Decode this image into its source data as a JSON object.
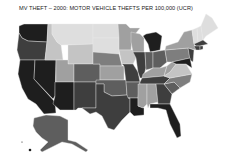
{
  "title": "MV THEFT – 2000: MOTOR VEHICLE THEFTS PER 100,000 (UCR)",
  "legend": null,
  "shades": {
    "very_dark": "#1e1e1e",
    "dark": "#3e3e3e",
    "mid_dark": "#5e5e5e",
    "mid": "#7e7e7e",
    "mid_light": "#a0a0a0",
    "light": "#c4c4c4",
    "very_light": "#dedede"
  },
  "states": [
    {
      "id": "WA",
      "shade": "very_dark"
    },
    {
      "id": "OR",
      "shade": "dark"
    },
    {
      "id": "CA",
      "shade": "very_dark"
    },
    {
      "id": "NV",
      "shade": "very_dark"
    },
    {
      "id": "ID",
      "shade": "light"
    },
    {
      "id": "MT",
      "shade": "very_light"
    },
    {
      "id": "WY",
      "shade": "light"
    },
    {
      "id": "UT",
      "shade": "mid_light"
    },
    {
      "id": "AZ",
      "shade": "very_dark"
    },
    {
      "id": "CO",
      "shade": "mid_dark"
    },
    {
      "id": "NM",
      "shade": "dark"
    },
    {
      "id": "ND",
      "shade": "very_light"
    },
    {
      "id": "SD",
      "shade": "very_light"
    },
    {
      "id": "NE",
      "shade": "mid"
    },
    {
      "id": "KS",
      "shade": "mid_light"
    },
    {
      "id": "OK",
      "shade": "mid_dark"
    },
    {
      "id": "TX",
      "shade": "dark"
    },
    {
      "id": "MN",
      "shade": "mid_light"
    },
    {
      "id": "IA",
      "shade": "light"
    },
    {
      "id": "MO",
      "shade": "dark"
    },
    {
      "id": "AR",
      "shade": "mid_dark"
    },
    {
      "id": "LA",
      "shade": "very_dark"
    },
    {
      "id": "WI",
      "shade": "mid_light"
    },
    {
      "id": "IL",
      "shade": "dark"
    },
    {
      "id": "MI",
      "shade": "very_dark"
    },
    {
      "id": "IN",
      "shade": "mid_dark"
    },
    {
      "id": "OH",
      "shade": "mid_dark"
    },
    {
      "id": "KY",
      "shade": "mid_light"
    },
    {
      "id": "TN",
      "shade": "dark"
    },
    {
      "id": "MS",
      "shade": "mid_light"
    },
    {
      "id": "AL",
      "shade": "mid_light"
    },
    {
      "id": "GA",
      "shade": "dark"
    },
    {
      "id": "FL",
      "shade": "very_dark"
    },
    {
      "id": "SC",
      "shade": "mid_dark"
    },
    {
      "id": "NC",
      "shade": "mid"
    },
    {
      "id": "VA",
      "shade": "light"
    },
    {
      "id": "WV",
      "shade": "mid_light"
    },
    {
      "id": "PA",
      "shade": "mid"
    },
    {
      "id": "NY",
      "shade": "mid_light"
    },
    {
      "id": "NJ",
      "shade": "dark"
    },
    {
      "id": "MD",
      "shade": "very_dark"
    },
    {
      "id": "VT",
      "shade": "very_light"
    },
    {
      "id": "NH",
      "shade": "very_light"
    },
    {
      "id": "ME",
      "shade": "very_light"
    },
    {
      "id": "MA",
      "shade": "dark"
    },
    {
      "id": "CT",
      "shade": "dark"
    },
    {
      "id": "RI",
      "shade": "dark"
    },
    {
      "id": "AK",
      "shade": "mid_dark"
    },
    {
      "id": "HI",
      "shade": "very_dark"
    }
  ]
}
